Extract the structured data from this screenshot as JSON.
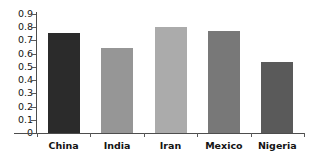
{
  "chart_data": {
    "type": "bar",
    "title": "",
    "xlabel": "",
    "ylabel": "",
    "categories": [
      "China",
      "India",
      "Iran",
      "Mexico",
      "Nigeria"
    ],
    "values": [
      0.755,
      0.64,
      0.8,
      0.775,
      0.54
    ],
    "bar_colors": [
      "#2b2b2b",
      "#969696",
      "#ababab",
      "#787878",
      "#5a5a5a"
    ],
    "ylim": [
      0,
      0.9
    ],
    "ytick_labels": [
      "0.9",
      "0.8",
      "0.7",
      "0.6",
      "0.5",
      "0.4",
      "0.3",
      "0.2",
      "0.1",
      "0"
    ],
    "ytick_values": [
      0.9,
      0.8,
      0.7,
      0.6,
      0.5,
      0.4,
      0.3,
      0.2,
      0.1,
      0
    ],
    "grid": false,
    "legend": "none",
    "axis_color": "#4d4d4d",
    "background": "#ffffff",
    "title_remnant": "",
    "series": [
      {
        "name": "value",
        "values": [
          0.755,
          0.64,
          0.8,
          0.775,
          0.54
        ]
      }
    ]
  }
}
